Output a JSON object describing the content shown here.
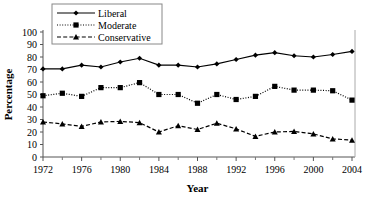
{
  "chart_data": {
    "type": "line",
    "title": "",
    "xlabel": "Year",
    "ylabel": "Percentage",
    "xlim": [
      1972,
      2004
    ],
    "ylim": [
      0,
      100
    ],
    "grid": false,
    "legend_position": "top-center",
    "x": [
      1972,
      1974,
      1976,
      1978,
      1980,
      1982,
      1984,
      1986,
      1988,
      1990,
      1992,
      1994,
      1996,
      1998,
      2000,
      2002,
      2004
    ],
    "xticks": [
      1972,
      1976,
      1980,
      1984,
      1988,
      1992,
      1996,
      2000,
      2004
    ],
    "xtick_labels": [
      "1972",
      "1976",
      "1980",
      "1984",
      "1988",
      "1992",
      "1996",
      "2000",
      "2004"
    ],
    "xminor_ticks": [
      1974,
      1978,
      1982,
      1986,
      1990,
      1994,
      1998,
      2002
    ],
    "yticks": [
      0,
      10,
      20,
      30,
      40,
      50,
      60,
      70,
      80,
      90,
      100
    ],
    "ytick_labels": [
      "0",
      "10",
      "20",
      "30",
      "40",
      "50",
      "60",
      "70",
      "80",
      "90",
      "100"
    ],
    "series": [
      {
        "name": "Liberal",
        "marker": "diamond",
        "line_style": "solid",
        "color": "#000000",
        "values": [
          70.5,
          70.5,
          73.5,
          72.0,
          76.0,
          79.0,
          73.5,
          73.5,
          72.0,
          74.5,
          78.0,
          81.5,
          83.5,
          81.0,
          80.0,
          82.0,
          84.5
        ]
      },
      {
        "name": "Moderate",
        "marker": "square",
        "line_style": "dotted",
        "color": "#000000",
        "values": [
          49.0,
          51.0,
          48.5,
          55.5,
          55.5,
          59.5,
          50.0,
          50.0,
          43.0,
          50.0,
          46.0,
          48.5,
          56.5,
          53.5,
          53.5,
          53.0,
          45.5
        ]
      },
      {
        "name": "Conservative",
        "marker": "triangle",
        "line_style": "dashed",
        "color": "#000000",
        "values": [
          28.0,
          26.5,
          24.5,
          28.0,
          28.5,
          27.5,
          20.0,
          25.0,
          22.0,
          27.0,
          22.5,
          16.5,
          20.0,
          20.5,
          18.5,
          14.5,
          13.5
        ]
      }
    ]
  },
  "legend": {
    "items": [
      {
        "label": "Liberal"
      },
      {
        "label": "Moderate"
      },
      {
        "label": "Conservative"
      }
    ]
  }
}
